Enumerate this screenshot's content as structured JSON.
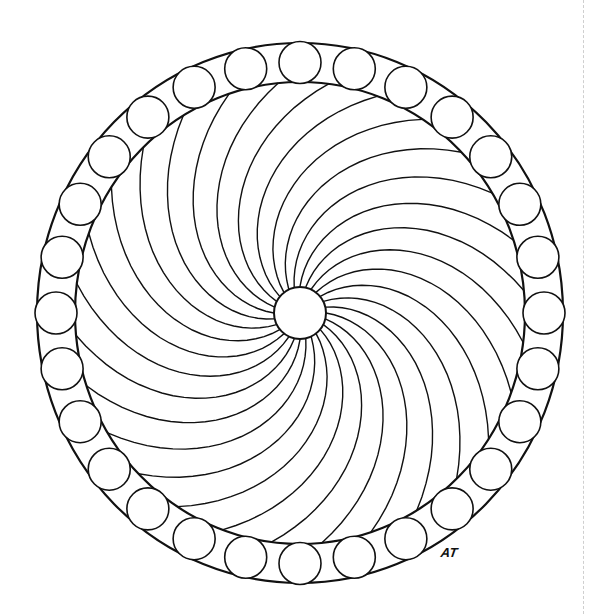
{
  "mandala": {
    "center": [
      300,
      313
    ],
    "outer_rx": 263,
    "outer_ry": 270,
    "inner_rx": 225,
    "inner_ry": 231,
    "hub_radius": 26,
    "ring_circle_count": 28,
    "ring_circle_radius": 21,
    "spiral_arm_count": 28,
    "stroke_color": "#111111",
    "fill_color": "#ffffff"
  },
  "signature": "AT"
}
